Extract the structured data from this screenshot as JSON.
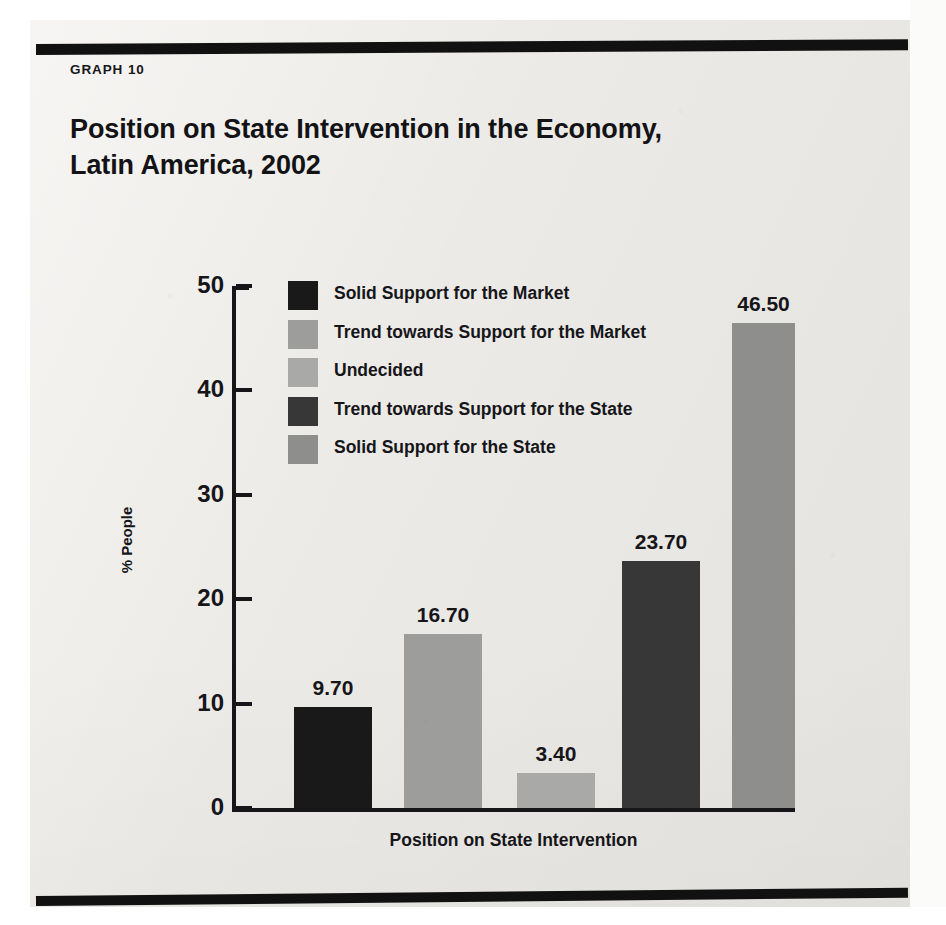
{
  "page": {
    "kicker": "GRAPH 10",
    "paper_color": "#eceae6",
    "rule_color": "#111111"
  },
  "chart_data": {
    "type": "bar",
    "title": "Position on State Intervention in the Economy, Latin America, 2002",
    "title_line1": "Position on State Intervention in the Economy,",
    "title_line2": "Latin America, 2002",
    "subtitle": "",
    "xlabel": "Position on State Intervention",
    "ylabel": "% People",
    "ylim": [
      0,
      50
    ],
    "yticks": [
      0,
      10,
      20,
      30,
      40,
      50
    ],
    "ytick_labels": [
      "0",
      "10",
      "20",
      "30",
      "40",
      "50"
    ],
    "grid": false,
    "legend_position": "upper-left-inside",
    "categories": [
      "Solid Support for the Market",
      "Trend towards Support for the Market",
      "Undecided",
      "Trend towards Support for the State",
      "Solid Support for the State"
    ],
    "values": [
      9.7,
      16.7,
      3.4,
      23.7,
      46.5
    ],
    "value_labels": [
      "9.70",
      "16.70",
      "3.40",
      "23.70",
      "46.50"
    ],
    "colors": [
      "#191919",
      "#9d9d9c",
      "#a9a9a8",
      "#373737",
      "#8e8e8d"
    ],
    "bars": [
      {
        "label": "Solid Support for the Market",
        "value": 9.7,
        "value_label": "9.70",
        "color": "#191919"
      },
      {
        "label": "Trend towards Support for the Market",
        "value": 16.7,
        "value_label": "16.70",
        "color": "#9d9d9c"
      },
      {
        "label": "Undecided",
        "value": 3.4,
        "value_label": "3.40",
        "color": "#a9a9a8"
      },
      {
        "label": "Trend towards Support for the State",
        "value": 23.7,
        "value_label": "23.70",
        "color": "#373737"
      },
      {
        "label": "Solid Support for the State",
        "value": 46.5,
        "value_label": "46.50",
        "color": "#8e8e8d"
      }
    ],
    "legend": [
      {
        "label": "Solid Support for the Market",
        "color": "#191919"
      },
      {
        "label": "Trend towards Support for the Market",
        "color": "#9d9d9c"
      },
      {
        "label": "Undecided",
        "color": "#a9a9a8"
      },
      {
        "label": "Trend towards Support for the State",
        "color": "#373737"
      },
      {
        "label": " Solid Support for the State",
        "color": "#8e8e8d"
      }
    ]
  }
}
